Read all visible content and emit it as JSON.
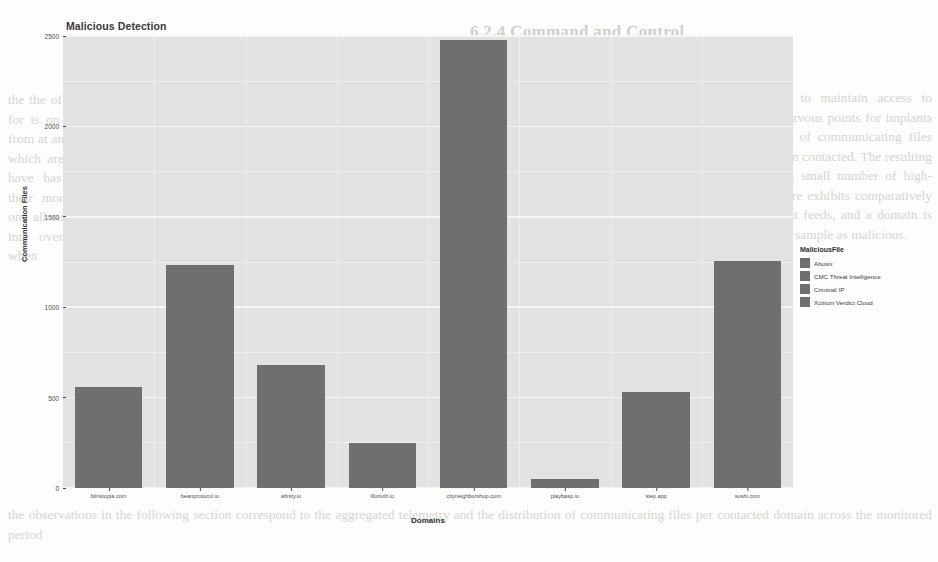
{
  "chart_data": {
    "type": "bar",
    "title": "Malicious Detection",
    "xlabel": "Domains",
    "ylabel": "Communication Files",
    "categories": [
      "blinktopia.com",
      "beanprotocol.io",
      "afinity.io",
      "illuriuth.io",
      "cityneighborshop.com",
      "playbasp.io",
      "step.app",
      "sushi.com"
    ],
    "values": [
      560,
      1235,
      680,
      250,
      2480,
      50,
      530,
      1255
    ],
    "ylim": [
      0,
      2500
    ],
    "yticks": [
      "0",
      "500",
      "1000",
      "1500",
      "2000",
      "2500"
    ],
    "ytick_values": [
      0,
      500,
      1000,
      1500,
      2000,
      2500
    ],
    "grid": true,
    "bar_color": "#6f6f6f",
    "panel_color": "#e2e2e0",
    "legend_position": "right",
    "legend": {
      "title": "MaliciousFile",
      "entries": [
        {
          "label": "Abusix",
          "color": "#6f6f6f"
        },
        {
          "label": "CMC Threat Intelligence",
          "color": "#6f6f6f"
        },
        {
          "label": "Criminal IP",
          "color": "#6f6f6f"
        },
        {
          "label": "Xcitium Verdict Cloud",
          "color": "#6f6f6f"
        }
      ]
    }
  },
  "background_document": {
    "heading": "6.2.4 Command and Control",
    "left_column": "the the of to and in a for is on as by with from at an be this that which are not or but have has was were their more can will one all such other its into over also may when",
    "right_column": "Command and Control channels allow the adversary to maintain access to compromised hosts. The observed domains serve as rendezvous points for implants deployed during the campaign. We aggregate the count of communicating files reported by each reputation provider, grouped by the domain contacted. The resulting distribution shows a pronounced concentration around a small number of high-volume endpoints, while the remainder of the infrastructure exhibits comparatively low traffic. Verdicts were collected from four independent feeds, and a domain is retained whenever at least one feed classifies the associated sample as malicious.",
    "bottom_column": "the observations in the following section correspond to the aggregated telemetry and the distribution of communicating files per contacted domain across the monitored period"
  }
}
